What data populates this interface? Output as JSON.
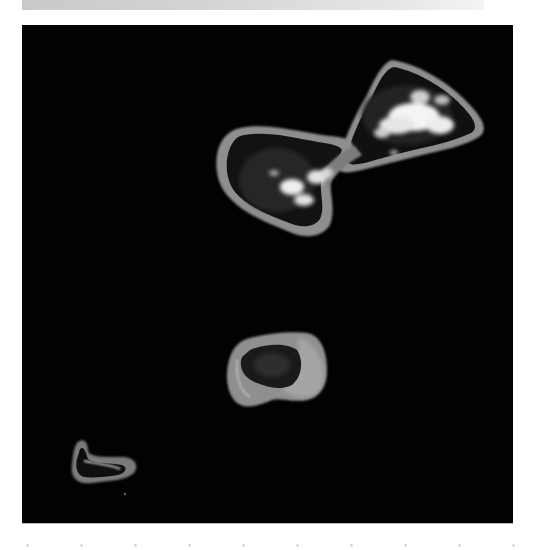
{
  "image": {
    "subject": "satellite view of three atolls",
    "palette": {
      "ocean": "#020202",
      "reef_rim": "#8a8a8a",
      "reef_rim_light": "#b5b5b5",
      "lagoon": "#141414",
      "land": "#2a2a2a",
      "cloud": "#f2f2f2",
      "top_bar": "#d4d4d4"
    },
    "features": [
      {
        "id": "large-atoll",
        "description": "large figure-eight atoll with clouds",
        "position": "upper-center-right"
      },
      {
        "id": "middle-atoll",
        "description": "small irregular atoll",
        "position": "lower-center"
      },
      {
        "id": "small-atoll",
        "description": "small crescent atoll",
        "position": "lower-left"
      }
    ]
  }
}
